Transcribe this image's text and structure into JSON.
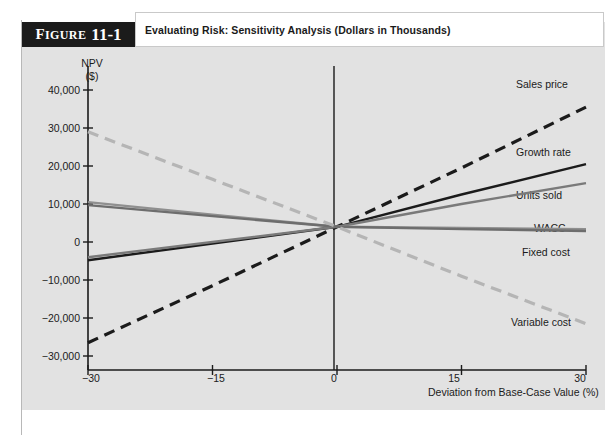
{
  "figure": {
    "tab_word": "Figure",
    "tab_number": "11-1",
    "caption": "Evaluating Risk: Sensitivity Analysis (Dollars in Thousands)"
  },
  "axes": {
    "y_title_line1": "NPV",
    "y_title_line2": "($)",
    "x_title": "Deviation from Base-Case Value (%)",
    "y_ticks": [
      "40,000",
      "30,000",
      "20,000",
      "10,000",
      "0",
      "−10,000",
      "−20,000",
      "−30,000"
    ],
    "x_ticks": [
      "−30",
      "−15",
      "0",
      "15",
      "30"
    ]
  },
  "colors": {
    "panel": "#e2e2e2",
    "sales_price": "#1b1b1b",
    "growth_rate": "#1b1b1b",
    "units_sold": "#7a7a7a",
    "wacc": "#8f8f8f",
    "fixed_cost": "#6d6d6d",
    "variable_cost": "#b5b5b5",
    "axis": "#1b1b1b"
  },
  "chart_data": {
    "type": "line",
    "title": "Evaluating Risk: Sensitivity Analysis (Dollars in Thousands)",
    "xlabel": "Deviation from Base-Case Value (%)",
    "ylabel": "NPV ($)",
    "xlim": [
      -30,
      30
    ],
    "ylim": [
      -30000,
      40000
    ],
    "xticks": [
      -30,
      -15,
      0,
      15,
      30
    ],
    "yticks": [
      -30000,
      -20000,
      -10000,
      0,
      10000,
      20000,
      30000,
      40000
    ],
    "grid": false,
    "legend": "inline-right-of-line-ends",
    "x": [
      -30,
      -15,
      0,
      15,
      30
    ],
    "series": [
      {
        "name": "Sales price",
        "style": "dashed",
        "color": "#1b1b1b",
        "values": [
          -26500,
          -11500,
          4000,
          19500,
          35500
        ]
      },
      {
        "name": "Growth rate",
        "style": "solid",
        "color": "#1b1b1b",
        "values": [
          -4800,
          -400,
          4000,
          12500,
          20500
        ]
      },
      {
        "name": "Units sold",
        "style": "solid",
        "color": "#7a7a7a",
        "values": [
          -4000,
          0,
          4000,
          10000,
          15500
        ]
      },
      {
        "name": "WACC",
        "style": "solid",
        "color": "#8f8f8f",
        "values": [
          10500,
          7200,
          4000,
          3700,
          3400
        ]
      },
      {
        "name": "Fixed cost",
        "style": "solid",
        "color": "#6d6d6d",
        "values": [
          9700,
          6800,
          4000,
          3400,
          2900
        ]
      },
      {
        "name": "Variable cost",
        "style": "dashed",
        "color": "#b5b5b5",
        "values": [
          29000,
          16500,
          4000,
          -9000,
          -21500
        ]
      }
    ],
    "annotations": [
      {
        "text": "Sales price",
        "x": 29,
        "y": 39000
      },
      {
        "text": "Growth rate",
        "x": 25,
        "y": 23500
      },
      {
        "text": "Units sold",
        "x": 25,
        "y": 16500
      },
      {
        "text": "WACC",
        "x": 27,
        "y": 6500
      },
      {
        "text": "Fixed cost",
        "x": 26,
        "y": 1000
      },
      {
        "text": "Variable cost",
        "x": 23,
        "y": -20500
      }
    ]
  }
}
